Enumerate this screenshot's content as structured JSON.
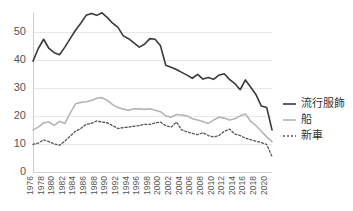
{
  "chart_data": {
    "type": "line",
    "title": "",
    "xlabel": "",
    "ylabel": "",
    "ylim": [
      0,
      57
    ],
    "yticks": [
      0,
      10,
      20,
      30,
      40,
      50
    ],
    "grid": true,
    "legend_position": "right",
    "x": [
      1976,
      1977,
      1978,
      1979,
      1980,
      1981,
      1982,
      1983,
      1984,
      1985,
      1986,
      1987,
      1988,
      1989,
      1990,
      1991,
      1992,
      1993,
      1994,
      1995,
      1996,
      1997,
      1998,
      1999,
      2000,
      2001,
      2002,
      2003,
      2004,
      2005,
      2006,
      2007,
      2008,
      2009,
      2010,
      2011,
      2012,
      2013,
      2014,
      2015,
      2016,
      2017,
      2018,
      2019,
      2020,
      2021
    ],
    "xtick_labels": [
      "1976",
      "1978",
      "1980",
      "1982",
      "1984",
      "1986",
      "1988",
      "1990",
      "1992",
      "1994",
      "1996",
      "1998",
      "2000",
      "2002",
      "2004",
      "2006",
      "2008",
      "2010",
      "2012",
      "2014",
      "2016",
      "2018",
      "2020"
    ],
    "series": [
      {
        "name": "流行服飾",
        "color": "#3a3a3a",
        "dash": "none",
        "width": 1.6,
        "values": [
          39.5,
          44.0,
          47.3,
          44.0,
          42.5,
          41.8,
          44.5,
          47.5,
          50.5,
          53.0,
          55.8,
          56.5,
          55.8,
          56.7,
          55.0,
          53.0,
          51.5,
          48.5,
          47.5,
          46.0,
          44.5,
          45.5,
          47.5,
          47.3,
          45.0,
          38.0,
          37.3,
          36.5,
          35.5,
          34.5,
          33.4,
          34.8,
          33.1,
          33.7,
          33.0,
          34.5,
          35.0,
          33.0,
          31.5,
          29.3,
          32.8,
          30.2,
          27.5,
          23.5,
          23.0,
          15.0
        ]
      },
      {
        "name": "船",
        "color": "#b5b5b5",
        "dash": "none",
        "width": 1.6,
        "values": [
          15.0,
          16.0,
          17.5,
          17.8,
          16.6,
          18.0,
          17.3,
          21.0,
          24.3,
          24.8,
          25.0,
          25.5,
          26.3,
          26.5,
          25.5,
          24.0,
          23.0,
          22.4,
          22.0,
          22.5,
          22.5,
          22.3,
          22.5,
          22.0,
          21.5,
          20.0,
          19.5,
          20.5,
          20.3,
          20.0,
          19.0,
          18.5,
          18.0,
          17.3,
          18.5,
          19.5,
          19.2,
          18.5,
          19.0,
          20.0,
          20.7,
          18.0,
          16.5,
          14.5,
          12.5,
          10.8
        ]
      },
      {
        "name": "新車",
        "color": "#555555",
        "dash": "2,2",
        "width": 1.3,
        "values": [
          9.8,
          10.3,
          11.5,
          10.8,
          10.0,
          9.5,
          11.0,
          12.8,
          14.5,
          15.5,
          17.0,
          17.3,
          18.2,
          17.8,
          17.5,
          16.5,
          15.5,
          15.8,
          16.0,
          16.3,
          16.5,
          17.0,
          17.0,
          17.5,
          17.8,
          16.5,
          16.0,
          17.8,
          15.0,
          14.3,
          13.8,
          13.3,
          14.0,
          13.0,
          12.5,
          13.0,
          14.5,
          15.3,
          13.5,
          13.0,
          12.0,
          11.5,
          11.0,
          10.5,
          9.8,
          5.5
        ]
      }
    ]
  },
  "legend": {
    "items": [
      {
        "label": "流行服飾"
      },
      {
        "label": "船"
      },
      {
        "label": "新車"
      }
    ]
  }
}
